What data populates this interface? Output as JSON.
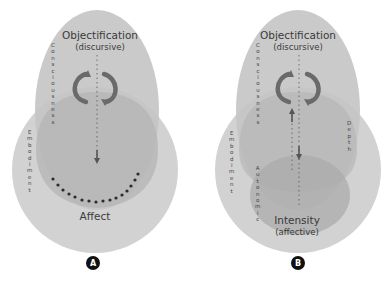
{
  "colors": {
    "background": "#ffffff",
    "outer_circle": "#d2d2d2",
    "upper_ellipse": "#bdbdbd",
    "inner_ellipse": "#acacac",
    "text": "#3a3a3a",
    "dots": "#2b2b2b",
    "badge": "#111111"
  },
  "panel_a": {
    "badge": "A",
    "title": "Objectification",
    "subtitle": "(discursive)",
    "bottom_label": "Affect",
    "vertical_labels": {
      "consciousness": "Consciousness",
      "embodiment": "Embodiment",
      "internalisation": "Internalisation"
    },
    "icons": [
      "cycle-arrows-icon",
      "down-arrow-icon",
      "dotted-arc-boundary"
    ]
  },
  "panel_b": {
    "badge": "B",
    "title": "Objectification",
    "subtitle": "(discursive)",
    "bottom_label": "Intensity",
    "bottom_sublabel": "(affective)",
    "vertical_labels": {
      "consciousness": "Consciousness",
      "embodiment": "Embodiment",
      "internalisation": "Internalisation",
      "externalisation": "Externalisation",
      "depth": "Depth",
      "autonomic": "Autonomic"
    },
    "icons": [
      "cycle-arrows-icon",
      "down-arrow-icon",
      "up-arrow-icon"
    ]
  }
}
